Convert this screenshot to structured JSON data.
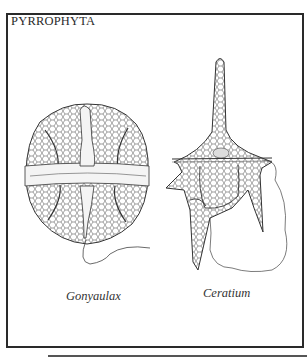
{
  "figure": {
    "title": "PYRROPHYTA",
    "organisms": [
      {
        "name": "Gonyaulax",
        "illustration": "gonyaulax-cell-icon"
      },
      {
        "name": "Ceratium",
        "illustration": "ceratium-cell-icon"
      }
    ],
    "colors": {
      "ink": "#2a2a2a",
      "background": "#ffffff"
    }
  }
}
